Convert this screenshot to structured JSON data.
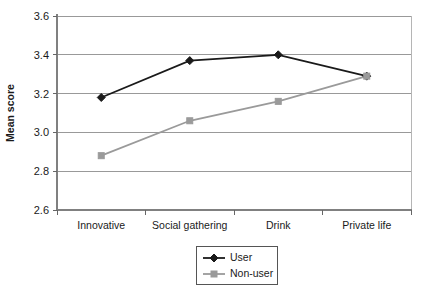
{
  "chart_data": {
    "type": "line",
    "title": "",
    "xlabel": "",
    "ylabel": "Mean score",
    "categories": [
      "Innovative",
      "Social gathering",
      "Drink",
      "Private life"
    ],
    "ylim": [
      2.6,
      3.6
    ],
    "yticks": [
      "2.6",
      "2.8",
      "3.0",
      "3.2",
      "3.4",
      "3.6"
    ],
    "ytick_values": [
      2.6,
      2.8,
      3.0,
      3.2,
      3.4,
      3.6
    ],
    "grid": true,
    "legend_position": "bottom-right",
    "series": [
      {
        "name": "User",
        "color": "#1a1a1a",
        "marker": "diamond",
        "values": [
          3.18,
          3.37,
          3.4,
          3.29
        ]
      },
      {
        "name": "Non-user",
        "color": "#9a9a9a",
        "marker": "square",
        "values": [
          2.88,
          3.06,
          3.16,
          3.29
        ]
      }
    ]
  },
  "legend": {
    "items": [
      {
        "label": "User"
      },
      {
        "label": "Non-user"
      }
    ]
  },
  "colors": {
    "user_series": "#1a1a1a",
    "nonuser_series": "#9a9a9a",
    "gridline": "#999999",
    "axis": "#808080",
    "background": "#ffffff"
  }
}
